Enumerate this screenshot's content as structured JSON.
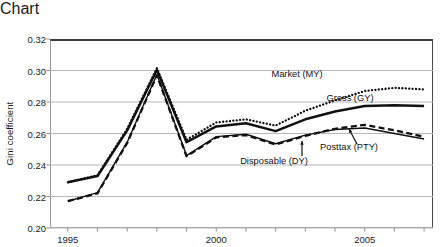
{
  "chart_data": {
    "type": "line",
    "title": "",
    "xlabel": "",
    "ylabel": "Gini coefficient",
    "xlim": [
      1994.4,
      2007.3
    ],
    "ylim": [
      0.2,
      0.32
    ],
    "ytick_labels": [
      "0.32",
      "0.30",
      "0.28",
      "0.26",
      "0.24",
      "0.22",
      "0.20"
    ],
    "ytick_values": [
      0.32,
      0.3,
      0.28,
      0.26,
      0.24,
      0.22,
      0.2
    ],
    "xtick_labels": [
      "1995",
      "2000",
      "2005"
    ],
    "xtick_values": [
      1995,
      2000,
      2005
    ],
    "grid": "horizontal",
    "legend": "inline-annotations",
    "x": [
      1995,
      1996,
      1997,
      1998,
      1999,
      2000,
      2001,
      2002,
      2003,
      2004,
      2005,
      2006,
      2007
    ],
    "series": [
      {
        "name": "Market (MY)",
        "style": "dotted",
        "values": [
          0.229,
          0.2335,
          0.263,
          0.3015,
          0.256,
          0.267,
          0.269,
          0.265,
          0.2745,
          0.281,
          0.287,
          0.289,
          0.288
        ]
      },
      {
        "name": "Gross (GY)",
        "style": "solid-thick",
        "values": [
          0.229,
          0.233,
          0.262,
          0.3005,
          0.2545,
          0.2645,
          0.2665,
          0.2615,
          0.269,
          0.274,
          0.2775,
          0.278,
          0.2775
        ]
      },
      {
        "name": "Posttax (PTY)",
        "style": "dashed",
        "values": [
          0.217,
          0.222,
          0.254,
          0.297,
          0.2455,
          0.2575,
          0.259,
          0.253,
          0.2585,
          0.263,
          0.2655,
          0.262,
          0.258
        ]
      },
      {
        "name": "Disposable (DY)",
        "style": "solid-thin",
        "values": [
          0.217,
          0.2225,
          0.2545,
          0.2975,
          0.246,
          0.258,
          0.2595,
          0.2535,
          0.259,
          0.2625,
          0.2635,
          0.26,
          0.2565
        ]
      }
    ],
    "annotations": [
      {
        "name": "market-label",
        "text": "Market (MY)",
        "x_px": 297,
        "y_px": 56
      },
      {
        "name": "gross-label",
        "text": "Gross (GY)",
        "x_px": 350,
        "y_px": 80
      },
      {
        "name": "posttax-label",
        "text": "Posttax (PTY)",
        "x_px": 349,
        "y_px": 129
      },
      {
        "name": "disposable-label",
        "text": "Disposable (DY)",
        "x_px": 274,
        "y_px": 143
      }
    ]
  },
  "colors": {
    "line": "#111111",
    "grid": "#b7b7b7",
    "axis": "#4a4a4a",
    "text": "#1a1a1a",
    "background": "#ffffff"
  }
}
